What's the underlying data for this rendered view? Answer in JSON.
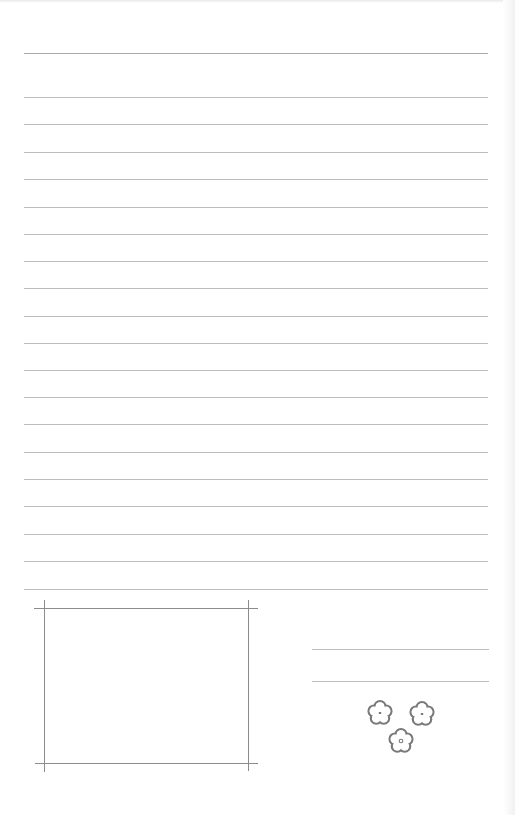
{
  "document": {
    "type": "stationery-letter-paper",
    "colors": {
      "paper": "#ffffff",
      "ruled_line": "#bdbdbd",
      "frame_line": "#8c8c8c",
      "flower_outline": "#7a7a7a"
    },
    "ruled_lines": {
      "x_start": 24,
      "x_end": 488,
      "y_positions": [
        53,
        97,
        124,
        152,
        179,
        207,
        234,
        261,
        288,
        316,
        343,
        370,
        397,
        424,
        452,
        479,
        506,
        534,
        561,
        589
      ]
    },
    "photo_frame": {
      "horizontal_lines": [
        {
          "y": 608,
          "x1": 34,
          "x2": 258
        },
        {
          "y": 763,
          "x1": 35,
          "x2": 258
        }
      ],
      "vertical_lines": [
        {
          "x": 44,
          "y1": 600,
          "y2": 772
        },
        {
          "x": 248,
          "y1": 600,
          "y2": 771
        }
      ]
    },
    "signature_lines": [
      {
        "y": 649,
        "x1": 312,
        "x2": 489
      },
      {
        "y": 681,
        "x1": 312,
        "x2": 489
      }
    ],
    "flowers": [
      {
        "icon": "flower-icon",
        "cx": 380,
        "cy": 713,
        "center": "dot"
      },
      {
        "icon": "flower-icon",
        "cx": 422,
        "cy": 714,
        "center": "dot"
      },
      {
        "icon": "flower-icon",
        "cx": 401,
        "cy": 741,
        "center": "ring"
      }
    ]
  }
}
